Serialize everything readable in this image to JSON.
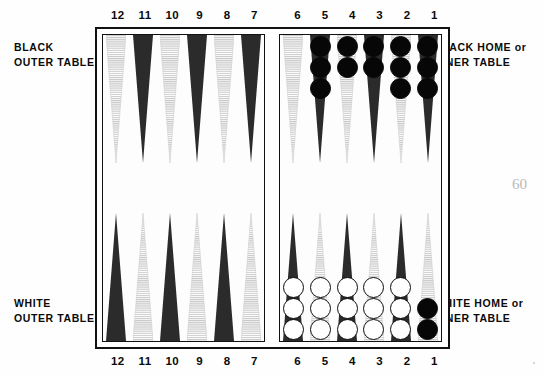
{
  "page": {
    "number": "60"
  },
  "captions": {
    "black_outer": {
      "line1": "BLACK",
      "line2": "OUTER TABLE"
    },
    "white_outer": {
      "line1": "WHITE",
      "line2": "OUTER TABLE"
    },
    "black_home": {
      "line1_main": "BLACK HOME",
      "line1_or": "or",
      "line2": "INNER TABLE"
    },
    "white_home": {
      "line1_main": "WHITE HOME",
      "line1_or": "or",
      "line2": "INNER TABLE"
    }
  },
  "numbers": {
    "left_half": [
      "12",
      "11",
      "10",
      "9",
      "8",
      "7"
    ],
    "right_half": [
      "6",
      "5",
      "4",
      "3",
      "2",
      "1"
    ]
  },
  "colors": {
    "point_dark": "#2b2b2b",
    "point_light": "#c9c9c9",
    "checker_black": "#070707",
    "checker_white": "#ffffff",
    "frame": "#111111",
    "page_number": "#b8b8b8"
  },
  "board": {
    "quadrants": {
      "black_outer_top": {
        "label": "BLACK OUTER TABLE",
        "points": [
          {
            "number": "12",
            "shade": "light",
            "checkers": []
          },
          {
            "number": "11",
            "shade": "dark",
            "checkers": []
          },
          {
            "number": "10",
            "shade": "light",
            "checkers": []
          },
          {
            "number": "9",
            "shade": "dark",
            "checkers": []
          },
          {
            "number": "8",
            "shade": "light",
            "checkers": []
          },
          {
            "number": "7",
            "shade": "dark",
            "checkers": []
          }
        ]
      },
      "black_home_top": {
        "label": "BLACK HOME or INNER TABLE",
        "points": [
          {
            "number": "6",
            "shade": "light",
            "checkers": []
          },
          {
            "number": "5",
            "shade": "dark",
            "checkers": [
              "black",
              "black",
              "black"
            ]
          },
          {
            "number": "4",
            "shade": "light",
            "checkers": [
              "black",
              "black"
            ]
          },
          {
            "number": "3",
            "shade": "dark",
            "checkers": [
              "black",
              "black"
            ]
          },
          {
            "number": "2",
            "shade": "light",
            "checkers": [
              "black",
              "black",
              "black"
            ]
          },
          {
            "number": "1",
            "shade": "dark",
            "checkers": [
              "black",
              "black",
              "black"
            ]
          }
        ]
      },
      "white_outer_bottom": {
        "label": "WHITE OUTER TABLE",
        "points": [
          {
            "number": "12",
            "shade": "dark",
            "checkers": []
          },
          {
            "number": "11",
            "shade": "light",
            "checkers": []
          },
          {
            "number": "10",
            "shade": "dark",
            "checkers": []
          },
          {
            "number": "9",
            "shade": "light",
            "checkers": []
          },
          {
            "number": "8",
            "shade": "dark",
            "checkers": []
          },
          {
            "number": "7",
            "shade": "light",
            "checkers": []
          }
        ]
      },
      "white_home_bottom": {
        "label": "WHITE HOME or INNER TABLE",
        "points": [
          {
            "number": "6",
            "shade": "dark",
            "checkers": [
              "white",
              "white",
              "white"
            ]
          },
          {
            "number": "5",
            "shade": "light",
            "checkers": [
              "white",
              "white",
              "white"
            ]
          },
          {
            "number": "4",
            "shade": "dark",
            "checkers": [
              "white",
              "white",
              "white"
            ]
          },
          {
            "number": "3",
            "shade": "light",
            "checkers": [
              "white",
              "white",
              "white"
            ]
          },
          {
            "number": "2",
            "shade": "dark",
            "checkers": [
              "white",
              "white",
              "white"
            ]
          },
          {
            "number": "1",
            "shade": "light",
            "checkers": [
              "black",
              "black"
            ]
          }
        ]
      }
    }
  }
}
